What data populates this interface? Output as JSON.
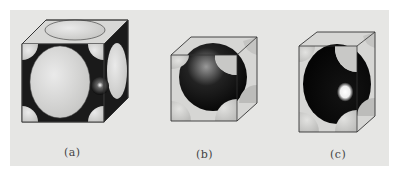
{
  "figure": {
    "background": "#e6e6e4",
    "panels": [
      {
        "id": "a",
        "label": "(a)",
        "description": "Face-centered cubic unit cell (hard-sphere model)"
      },
      {
        "id": "b",
        "label": "(b)",
        "description": "Body-centered cubic unit cell (hard-sphere model)"
      },
      {
        "id": "c",
        "label": "(c)",
        "description": "Body-centered tetragonal unit cell (hard-sphere model)"
      }
    ],
    "colors": {
      "sphere_light": "#d4d4d2",
      "sphere_shadow": "#111111",
      "edge": "#3a3a3a",
      "highlight": "#f4f4f4"
    }
  }
}
